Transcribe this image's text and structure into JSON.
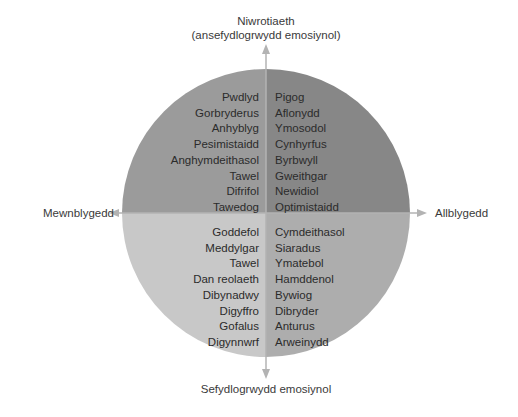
{
  "colors": {
    "top_left": "#9b9b9b",
    "top_right": "#878787",
    "bottom_left": "#c8c8c8",
    "bottom_right": "#adadad",
    "axis": "#b3b3b3",
    "text": "#2b2b2b"
  },
  "axes": {
    "top": {
      "line1": "Niwrotiaeth",
      "line2": "(ansefydlogrwydd emosiynol)"
    },
    "bottom": "Sefydlogrwydd emosiynol",
    "left": "Mewnblygedd",
    "right": "Allblygedd"
  },
  "quadrants": {
    "top_left": [
      "Pwdlyd",
      "Gorbryderus",
      "Anhyblyg",
      "Pesimistaidd",
      "Anghymdeithasol",
      "Tawel",
      "Difrifol",
      "Tawedog"
    ],
    "top_right": [
      "Pigog",
      "Aflonydd",
      "Ymosodol",
      "Cynhyrfus",
      "Byrbwyll",
      "Gweithgar",
      "Newidiol",
      "Optimistaidd"
    ],
    "bottom_left": [
      "Goddefol",
      "Meddylgar",
      "Tawel",
      "Dan reolaeth",
      "Dibynadwy",
      "Digyffro",
      "Gofalus",
      "Digynnwrf"
    ],
    "bottom_right": [
      "Cymdeithasol",
      "Siaradus",
      "Ymatebol",
      "Hamddenol",
      "Bywiog",
      "Dibryder",
      "Anturus",
      "Arweinydd"
    ]
  }
}
